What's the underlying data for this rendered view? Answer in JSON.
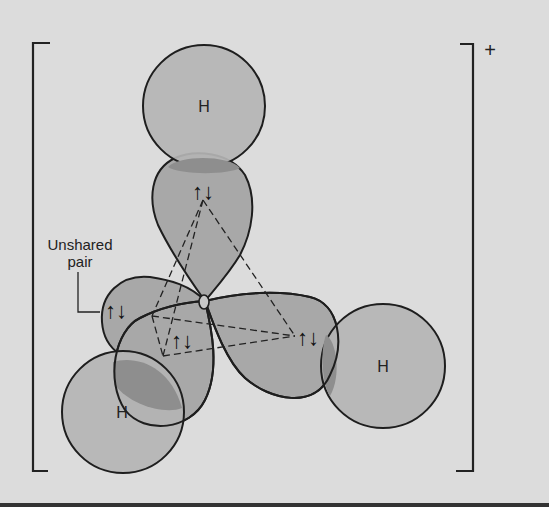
{
  "diagram": {
    "charge": "+",
    "atom_labels": {
      "h_top": "H",
      "h_right": "H",
      "h_bottom_left": "H"
    },
    "annotation": {
      "line1": "Unshared",
      "line2": "pair"
    },
    "spin_pair_glyph": "↑↓",
    "colors": {
      "background": "#dcdcdc",
      "lobe_fill": "#a8a8a8",
      "h_fill": "#b4b4b4",
      "overlap_fill": "#8e8e8e",
      "stroke": "#1e1e1e"
    }
  }
}
